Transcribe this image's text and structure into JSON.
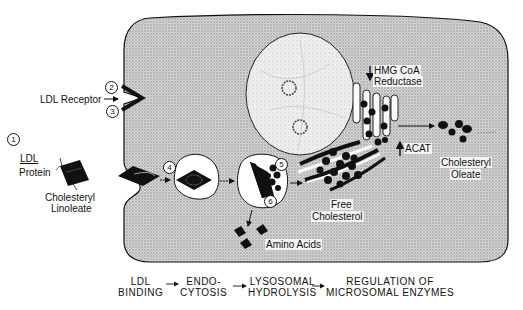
{
  "diagram": {
    "type": "cell-pathway",
    "step_markers": [
      "1",
      "2",
      "3",
      "4",
      "5",
      "6"
    ],
    "labels": {
      "ldl_receptor": "LDL Receptor",
      "ldl": "LDL",
      "protein": "Protein",
      "cholesteryl_linoleate_1": "Cholesteryl",
      "cholesteryl_linoleate_2": "Linoleate",
      "hmg_1": "HMG CoA",
      "hmg_2": "Reductase",
      "acat": "ACAT",
      "cholesteryl_oleate_1": "Cholesteryl",
      "cholesteryl_oleate_2": "Oleate",
      "free_cholesterol_1": "Free",
      "free_cholesterol_2": "Cholesterol",
      "amino_acids": "Amino Acids"
    },
    "regulation": {
      "hmg_coa_reductase": "down",
      "acat": "up"
    },
    "pathway_steps": [
      {
        "line1": "LDL",
        "line2": "BINDING"
      },
      {
        "line1": "ENDO-",
        "line2": "CYTOSIS"
      },
      {
        "line1": "LYSOSOMAL",
        "line2": "HYDROLYSIS"
      },
      {
        "line1": "REGULATION OF",
        "line2": "MICROSOMAL ENZYMES"
      }
    ],
    "colors": {
      "cytoplasm": "#c9c9c9",
      "nucleus": "#ececec",
      "ink": "#111111",
      "vesicle": "#ffffff"
    }
  }
}
